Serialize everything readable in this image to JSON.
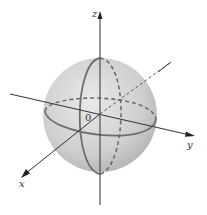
{
  "diagram": {
    "type": "3d-coordinate-sphere",
    "labels": {
      "x_axis": "x",
      "y_axis": "y",
      "z_axis": "z",
      "origin": "0"
    },
    "colors": {
      "sphere_fill_light": "#e6e6e6",
      "sphere_fill_dark": "#b9b9b9",
      "great_circle": "#6e6e6e",
      "axis": "#333333",
      "background": "#ffffff"
    },
    "elements": [
      "sphere centered at origin",
      "equator great circle (front solid, back dashed)",
      "meridian great circle in xz-plane (front solid, back dashed)",
      "x, y, z axes with arrowheads"
    ]
  }
}
